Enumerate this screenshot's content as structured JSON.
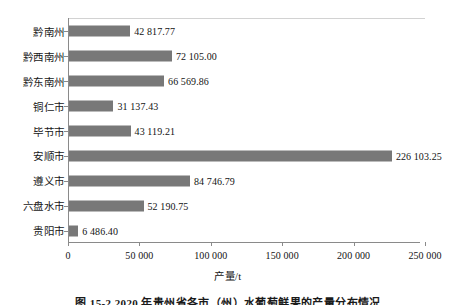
{
  "chart_data": {
    "type": "bar",
    "orientation": "horizontal",
    "title": "",
    "xlabel": "产量/t",
    "ylabel": "",
    "xlim": [
      0,
      250000
    ],
    "grid": false,
    "legend": null,
    "bar_color": "#787878",
    "categories": [
      "黔南州",
      "黔西南州",
      "黔东南州",
      "铜仁市",
      "毕节市",
      "安顺市",
      "遵义市",
      "六盘水市",
      "贵阳市"
    ],
    "values": [
      42817.77,
      72105.0,
      66569.86,
      31137.43,
      43119.21,
      226103.25,
      84746.79,
      52190.75,
      6486.4
    ],
    "value_labels": [
      "42 817.77",
      "72 105.00",
      "66 569.86",
      "31 137.43",
      "43 119.21",
      "226 103.25",
      "84 746.79",
      "52 190.75",
      "6 486.40"
    ],
    "xticks": [
      0,
      50000,
      100000,
      150000,
      200000,
      250000
    ],
    "xtick_labels": [
      "0",
      "50 000",
      "100 000",
      "150 000",
      "200 000",
      "250 000"
    ]
  },
  "axis": {
    "x_title": "产量/t"
  },
  "caption": {
    "text": "图 15-2   2020 年贵州省各市（州）水葡萄鲜果的产量分布情况"
  }
}
